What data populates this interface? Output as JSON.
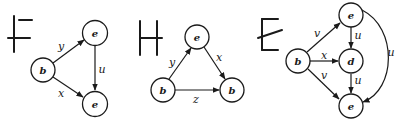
{
  "graphs": [
    {
      "id": "F",
      "title": "F",
      "nodes": [
        {
          "id": "b",
          "label": "b",
          "x": 43,
          "y": 70
        },
        {
          "id": "e1",
          "label": "e",
          "x": 95,
          "y": 33
        },
        {
          "id": "e2",
          "label": "e",
          "x": 95,
          "y": 104
        }
      ],
      "edges": [
        {
          "from": "b",
          "to": "e1",
          "label": "y"
        },
        {
          "from": "b",
          "to": "e2",
          "label": "x"
        },
        {
          "from": "e1",
          "to": "e2",
          "label": "u"
        }
      ]
    },
    {
      "id": "H",
      "title": "H",
      "nodes": [
        {
          "id": "e",
          "label": "e",
          "x": 197,
          "y": 37
        },
        {
          "id": "b1",
          "label": "b",
          "x": 163,
          "y": 90
        },
        {
          "id": "b2",
          "label": "b",
          "x": 232,
          "y": 90
        }
      ],
      "edges": [
        {
          "from": "b1",
          "to": "e",
          "label": "y"
        },
        {
          "from": "e",
          "to": "b2",
          "label": "x"
        },
        {
          "from": "b1",
          "to": "b2",
          "label": "z"
        }
      ]
    },
    {
      "id": "E",
      "title": "E",
      "nodes": [
        {
          "id": "e1",
          "label": "e",
          "x": 351,
          "y": 15
        },
        {
          "id": "b",
          "label": "b",
          "x": 298,
          "y": 61
        },
        {
          "id": "d",
          "label": "d",
          "x": 351,
          "y": 61
        },
        {
          "id": "e2",
          "label": "e",
          "x": 351,
          "y": 106
        }
      ],
      "edges": [
        {
          "from": "b",
          "to": "e1",
          "label": "v"
        },
        {
          "from": "b",
          "to": "d",
          "label": "x"
        },
        {
          "from": "b",
          "to": "e2",
          "label": "v"
        },
        {
          "from": "e1",
          "to": "d",
          "label": "u"
        },
        {
          "from": "d",
          "to": "e2",
          "label": "u"
        },
        {
          "from": "e1",
          "to": "e2",
          "label": "u",
          "curved": true
        }
      ]
    }
  ]
}
